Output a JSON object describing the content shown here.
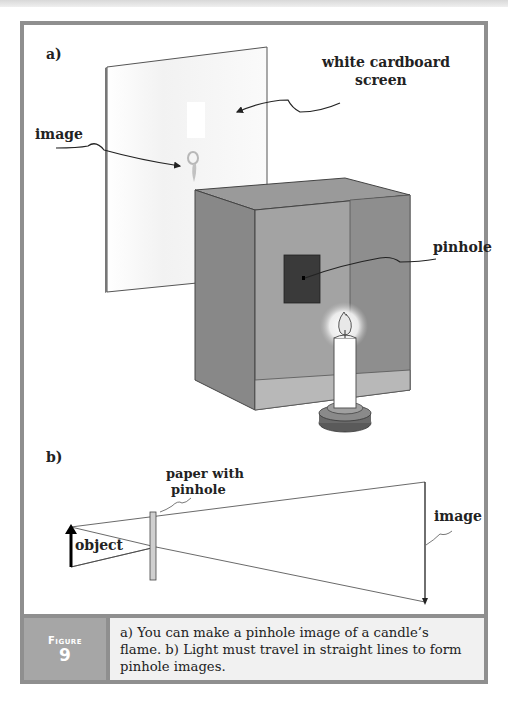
{
  "figure": {
    "part_a": {
      "label": "a)",
      "callouts": {
        "screen": "white cardboard screen",
        "screen_line1": "white cardboard",
        "screen_line2": "screen",
        "image": "image",
        "pinhole": "pinhole"
      }
    },
    "part_b": {
      "label": "b)",
      "callouts": {
        "paper_line1": "paper with",
        "paper_line2": "pinhole",
        "object": "object",
        "image": "image"
      }
    },
    "caption": {
      "figure_word": "Figure",
      "figure_number": "9",
      "text": "a) You can make a pinhole image of a candle’s flame. b) Light must travel in straight lines to form pinhole images."
    },
    "colors": {
      "frame": "#8f8f8f",
      "caption_label_bg": "#a6a6a6",
      "caption_text_bg": "#f1f1f1",
      "box_gray": "#8a8a8a",
      "pinhole_square": "#3a3a3a"
    }
  }
}
